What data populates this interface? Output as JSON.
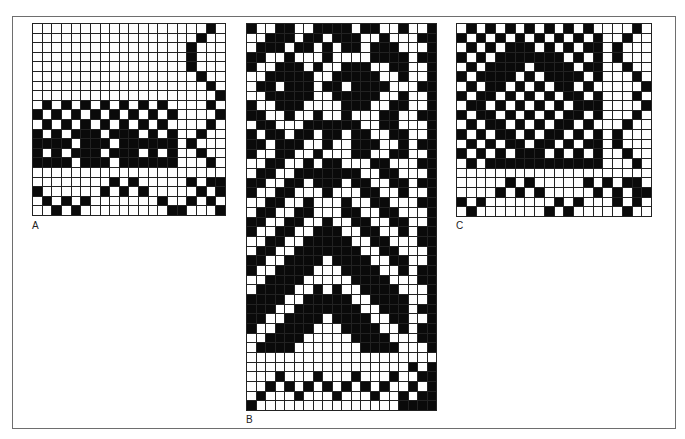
{
  "figure": {
    "panels": [
      {
        "label": "A",
        "cols": 20,
        "rows": [
          "00000000000000000010",
          "00000000000000000100",
          "00000000000000001000",
          "00000000000000001000",
          "00000000000000001000",
          "00000000000000000100",
          "00000000000000000010",
          "00000000000000000001",
          "01010101010101000010",
          "10101010101010100001",
          "01010101010101000010",
          "10101110111010100100",
          "11110111011111101000",
          "10101110111010100100",
          "11110111011111100010",
          "00000000000000000000",
          "00000000101000001011",
          "10000001010100000101",
          "01010100000001001010",
          "00101000000000110001"
        ]
      },
      {
        "label": "B",
        "cols": 20,
        "rows": [
          "10011001111011001001",
          "00111011011100100011",
          "01110110101101110001",
          "11001000100001111011",
          "10011101001110011001",
          "00111110011111001001",
          "01101110110111100011",
          "00111110011111001001",
          "10011100001110011001",
          "11001001001000110011",
          "01100011111100110001",
          "10110110110110011001",
          "11011100100111001011",
          "10011001000110011001",
          "00110010110001100011",
          "01100111111100110001",
          "11001101110110011011",
          "10011000100011001001",
          "00110010001001100011",
          "01100110001100110001",
          "11001100100110011001",
          "10011001110011001011",
          "00110011111001100011",
          "01100111111100110001",
          "11001111011110011001",
          "10011110001111001011",
          "00111100000111100011",
          "01111001010011110001",
          "11110011111001111001",
          "11100111111100111011",
          "11001111011110011001",
          "10011110001111001011",
          "00111100000111100011",
          "01111000000011110001",
          "00000000000000000000",
          "00000000000000000101",
          "00010001000100010011",
          "00101010101010100101",
          "01000100010001001011",
          "10000000000000001111"
        ]
      },
      {
        "label": "C",
        "cols": 20,
        "rows": [
          "01010101010101000010",
          "10101010101010100100",
          "01010111010101101000",
          "10101111111010101000",
          "01011110111101100100",
          "10111101011110100010",
          "01011010101101000001",
          "10110101010110100010",
          "01101010101011100001",
          "10110101010110100010",
          "01011010101101000100",
          "10101101011010101000",
          "01010110110101101000",
          "10101011101010100100",
          "01011111111111100010",
          "00000000000000000000",
          "00000101000001010110",
          "00001010100000101011",
          "10100000001010001010",
          "01000000010100000100"
        ]
      }
    ]
  }
}
